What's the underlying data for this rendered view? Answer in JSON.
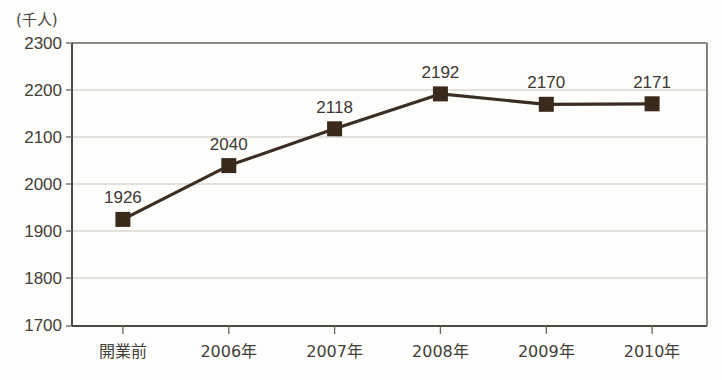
{
  "chart_data": {
    "type": "line",
    "title": "",
    "subtitle": "",
    "unit_label": "(千人)",
    "xlabel": "",
    "ylabel": "",
    "categories": [
      "開業前",
      "2006年",
      "2007年",
      "2008年",
      "2009年",
      "2010年"
    ],
    "values": [
      1926,
      2040,
      2118,
      2192,
      2170,
      2171
    ],
    "point_labels": [
      "1926",
      "2040",
      "2118",
      "2192",
      "2170",
      "2171"
    ],
    "series": [
      {
        "name": "利用者数",
        "values": [
          1926,
          2040,
          2118,
          2192,
          2170,
          2171
        ]
      }
    ],
    "ylim": [
      1700,
      2300
    ],
    "y_ticks": [
      2300,
      2200,
      2100,
      2000,
      1900,
      1800,
      1700
    ],
    "y_tick_labels": [
      "2300",
      "2200",
      "2100",
      "2000",
      "1900",
      "1800",
      "1700"
    ],
    "grid": true,
    "grid_axis": "y",
    "legend": "none",
    "marker": "filled-square",
    "colors": {
      "line": "#3b2d22",
      "marker": "#3a2a1c",
      "grid": "#c9c6bb",
      "axis": "#6b6558",
      "text": "#433e38",
      "background": "#fdfdfb"
    }
  }
}
